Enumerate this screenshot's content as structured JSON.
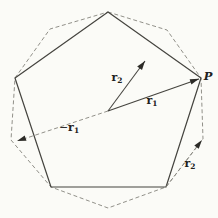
{
  "figure": {
    "type": "geometry-diagram",
    "colors": {
      "background": "#fbfbf7",
      "solid_line": "#45443f",
      "dashed_line": "#8b8a83",
      "arrowhead": "#2c2b27",
      "text": "#22211d"
    },
    "pentagon": {
      "points": "108,12 201,78 166,187 51,187 15,78",
      "vertices": [
        [
          108,
          12
        ],
        [
          201,
          78
        ],
        [
          166,
          187
        ],
        [
          51,
          187
        ],
        [
          15,
          78
        ]
      ]
    },
    "decagon": {
      "points": "108,12 167,30 201,78 203,139 166,187 108,208 51,187 11,140 15,78 50,29",
      "vertices": [
        [
          108,
          12
        ],
        [
          167,
          30
        ],
        [
          201,
          78
        ],
        [
          203,
          139
        ],
        [
          166,
          187
        ],
        [
          108,
          208
        ],
        [
          51,
          187
        ],
        [
          11,
          140
        ],
        [
          15,
          78
        ],
        [
          50,
          29
        ]
      ]
    },
    "arrows": {
      "r1": {
        "style": "solid",
        "line_d": "M108,111 L199,79",
        "head_d": "M199,78.8 L191.4,84.4 L189.6,79.2 Z"
      },
      "r2": {
        "style": "solid",
        "line_d": "M108,111 L145,61",
        "head_d": "M145,61 L142,70 L137.2,66.4 Z"
      },
      "neg_r1": {
        "style": "dashed",
        "line_d": "M108,111 L20,140.2",
        "head_d": "M17,141 L24.7,135.5 L26.5,140.8 Z"
      },
      "r2_edge": {
        "style": "dashed",
        "line_d": "M166,187 L200,142.5",
        "head_d": "M202,140 L198.7,148.8 L194.3,145.4 Z"
      }
    },
    "labels": {
      "r2_center": {
        "prefix": "",
        "base": "r",
        "sub": "2"
      },
      "r1": {
        "prefix": "",
        "base": "r",
        "sub": "1"
      },
      "neg_r1": {
        "prefix": "−",
        "base": "r",
        "sub": "1"
      },
      "r2_edge": {
        "prefix": "",
        "base": "r",
        "sub": "2"
      },
      "p_vertex": {
        "base": "P"
      }
    }
  }
}
